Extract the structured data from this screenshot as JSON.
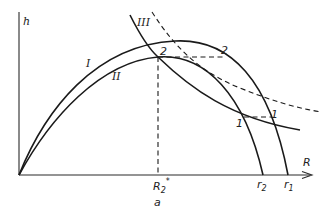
{
  "figure": {
    "panel_label": "a",
    "axes": {
      "y_label": "h",
      "x_label": "R"
    },
    "curves": [
      {
        "id": "I",
        "label": "I",
        "style": "solid"
      },
      {
        "id": "II",
        "label": "II",
        "style": "solid"
      },
      {
        "id": "III",
        "label": "III",
        "style": "solid"
      },
      {
        "id": "dashed",
        "label": "",
        "style": "dashed"
      }
    ],
    "points": {
      "p2_left": "2",
      "p2_right": "2",
      "p1_left": "1",
      "p1_right": "1"
    },
    "x_ticks": {
      "R2star_main": "R",
      "R2star_sub": "2",
      "R2star_sup": "*",
      "r2_main": "r",
      "r2_sub": "2",
      "r1_main": "r",
      "r1_sub": "1"
    },
    "colors": {
      "line": "#1a1a1a",
      "background": "#ffffff"
    }
  }
}
